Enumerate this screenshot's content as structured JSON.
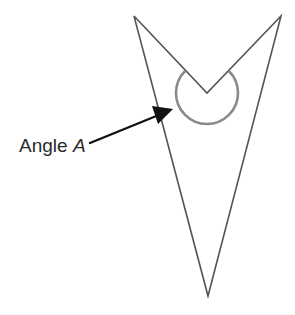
{
  "diagram": {
    "type": "concave-quadrilateral-with-reflex-angle",
    "label": {
      "prefix": "Angle ",
      "variable": "A"
    },
    "shape": {
      "vertices": [
        {
          "name": "top-left",
          "x": 134,
          "y": 16
        },
        {
          "name": "reflex-vertex",
          "x": 207,
          "y": 93
        },
        {
          "name": "top-right",
          "x": 281,
          "y": 16
        },
        {
          "name": "bottom",
          "x": 208,
          "y": 296
        }
      ],
      "stroke_color": "#555555"
    },
    "angle_marker": {
      "center": {
        "x": 207,
        "y": 93
      },
      "radius": 31,
      "color": "#8a8a8a"
    },
    "arrow": {
      "from": {
        "x": 90,
        "y": 143
      },
      "to": {
        "x": 173,
        "y": 109
      },
      "color": "#111111"
    }
  }
}
